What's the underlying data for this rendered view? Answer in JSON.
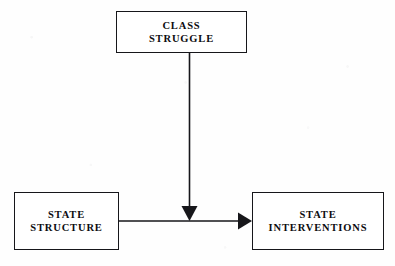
{
  "diagram": {
    "background_color": "#fefefe",
    "stroke_color": "#16161a",
    "text_color": "#0c0c0f",
    "cropped_header_text": "",
    "nodes": [
      {
        "id": "class-struggle",
        "label": "CLASS\nSTRUGGLE",
        "line1": "CLASS",
        "line2": "STRUGGLE",
        "x": 116,
        "y": 11,
        "width": 131,
        "height": 42
      },
      {
        "id": "state-structure",
        "label": "STATE\nSTRUCTURE",
        "line1": "STATE",
        "line2": "STRUCTURE",
        "x": 14,
        "y": 192,
        "width": 105,
        "height": 58
      },
      {
        "id": "state-interventions",
        "label": "STATE\nINTERVENTIONS",
        "line1": "STATE",
        "line2": "INTERVENTIONS",
        "x": 252,
        "y": 192,
        "width": 132,
        "height": 58
      }
    ],
    "edges": [
      {
        "id": "class-struggle-to-link",
        "from": "class-struggle",
        "to": "state-structure-to-state-interventions",
        "direction": "down",
        "arrowhead": "filled-triangle",
        "start_x": 189,
        "start_y": 53,
        "end_x": 189,
        "end_y": 221
      },
      {
        "id": "state-structure-to-state-interventions",
        "from": "state-structure",
        "to": "state-interventions",
        "direction": "right",
        "arrowhead": "filled-triangle",
        "start_x": 119,
        "start_y": 221,
        "end_x": 252,
        "end_y": 221
      }
    ]
  }
}
